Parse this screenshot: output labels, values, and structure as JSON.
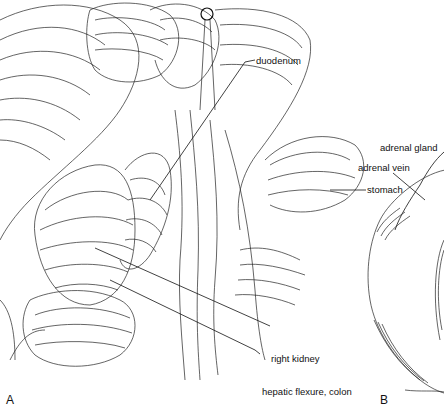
{
  "figure": {
    "panels": [
      {
        "letter": "A",
        "labels": {
          "duodenum": "duodenum",
          "stomach": "stomach",
          "right_kidney": "right kidney",
          "hepatic_flexure": "hepatic flexure, colon"
        }
      },
      {
        "letter": "B",
        "labels": {
          "adrenal_gland": "adrenal gland",
          "adrenal_vein": "adrenal vein"
        }
      }
    ]
  }
}
